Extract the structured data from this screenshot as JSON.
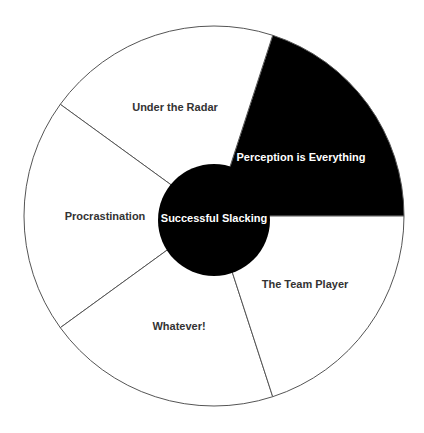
{
  "diagram": {
    "type": "segmented-circle",
    "center": {
      "x": 214,
      "y": 216
    },
    "outer_radius": 190,
    "inner_radius": 56,
    "inner_center": {
      "x": 214,
      "y": 220
    },
    "colors": {
      "background": "#ffffff",
      "stroke": "#555555",
      "highlight_fill": "#000000",
      "label_dark": "#333333",
      "label_light": "#ffffff"
    },
    "center_label": "Successful Slacking",
    "segments": [
      {
        "label": "Perception is Everything",
        "start_deg": 0,
        "end_deg": 72,
        "highlighted": true,
        "label_x": 301,
        "label_y": 161
      },
      {
        "label": "Under the Radar",
        "start_deg": 72,
        "end_deg": 144,
        "highlighted": false,
        "label_x": 175,
        "label_y": 111
      },
      {
        "label": "Procrastination",
        "start_deg": 144,
        "end_deg": 216,
        "highlighted": false,
        "label_x": 105,
        "label_y": 220
      },
      {
        "label": "Whatever!",
        "start_deg": 216,
        "end_deg": 288,
        "highlighted": false,
        "label_x": 179,
        "label_y": 330
      },
      {
        "label": "The Team Player",
        "start_deg": 288,
        "end_deg": 360,
        "highlighted": false,
        "label_x": 305,
        "label_y": 288
      }
    ]
  }
}
